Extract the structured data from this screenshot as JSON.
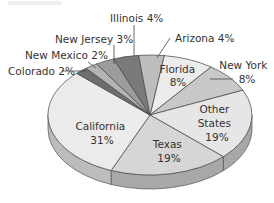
{
  "chart_data": {
    "type": "pie",
    "title": "",
    "style": "3d-exploded-none",
    "slices": [
      {
        "label": "Florida",
        "value": 8,
        "color": "#ececec",
        "display": "Florida\n8%"
      },
      {
        "label": "New York",
        "value": 8,
        "color": "#c8c8c8",
        "display": "New York\n8%"
      },
      {
        "label": "Other States",
        "value": 19,
        "color": "#e6e6e6",
        "display": "Other\nStates\n19%"
      },
      {
        "label": "Texas",
        "value": 19,
        "color": "#d6d6d6",
        "display": "Texas\n19%"
      },
      {
        "label": "California",
        "value": 31,
        "color": "#ebebeb",
        "display": "California\n31%"
      },
      {
        "label": "Colorado",
        "value": 2,
        "color": "#6e6e6e",
        "display": "Colorado 2%"
      },
      {
        "label": "New Mexico",
        "value": 2,
        "color": "#b4b4b4",
        "display": "New Mexico 2%"
      },
      {
        "label": "New Jersey",
        "value": 3,
        "color": "#9c9c9c",
        "display": "New Jersey 3%"
      },
      {
        "label": "Illinois",
        "value": 4,
        "color": "#7a7a7a",
        "display": "Illinois 4%"
      },
      {
        "label": "Arizona",
        "value": 4,
        "color": "#bdbdbd",
        "display": "Arizona 4%"
      }
    ],
    "legend": "none (callout labels)"
  },
  "labels": {
    "florida": [
      "Florida",
      "8%"
    ],
    "new_york": [
      "New York",
      "8%"
    ],
    "other_states": [
      "Other",
      "States",
      "19%"
    ],
    "texas": [
      "Texas",
      "19%"
    ],
    "california": [
      "California",
      "31%"
    ],
    "colorado": "Colorado 2%",
    "new_mexico": "New Mexico 2%",
    "new_jersey": "New Jersey 3%",
    "illinois": "Illinois 4%",
    "arizona": "Arizona 4%"
  }
}
